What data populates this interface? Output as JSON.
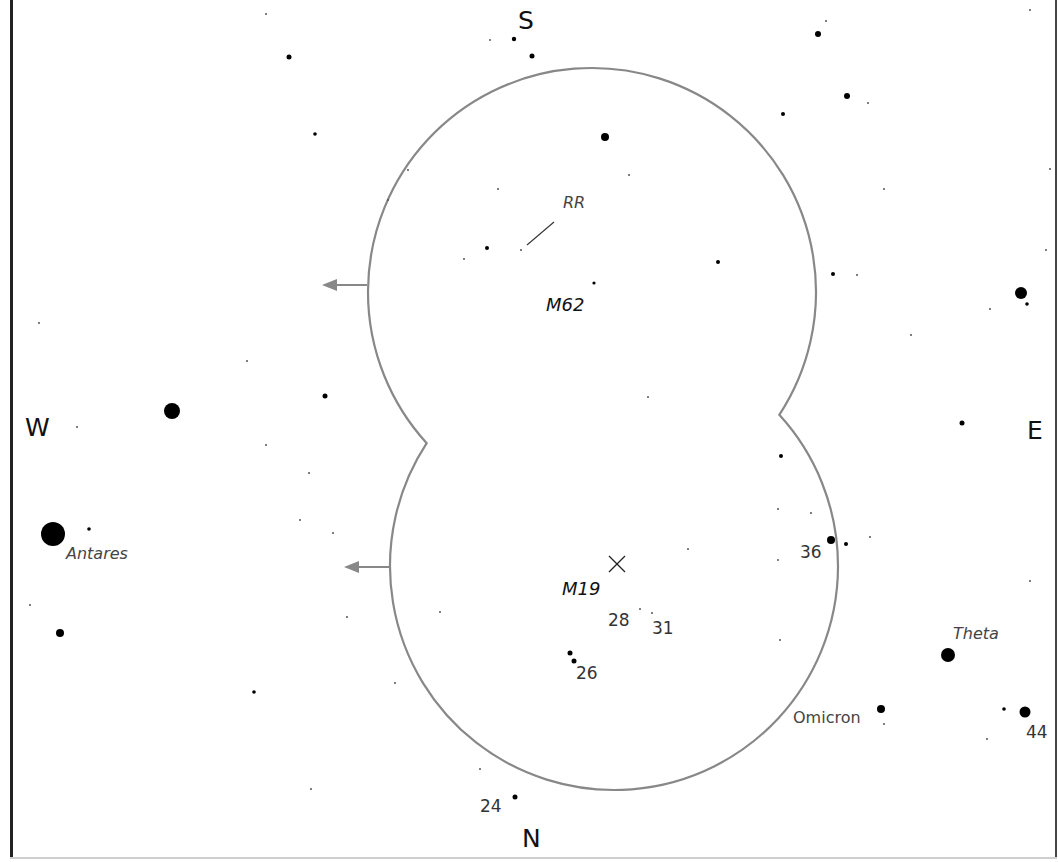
{
  "chart": {
    "background": "#ffffff",
    "field_color": "#888888",
    "star_color": "#000000",
    "directions": [
      {
        "id": "S",
        "label": "S",
        "x": 518,
        "y": 8
      },
      {
        "id": "N",
        "label": "N",
        "x": 522,
        "y": 826
      },
      {
        "id": "W",
        "label": "W",
        "x": 25,
        "y": 415
      },
      {
        "id": "E",
        "label": "E",
        "x": 1027,
        "y": 418
      }
    ],
    "fields_of_view": [
      {
        "name": "upper-field",
        "cx": 592,
        "cy": 292,
        "r": 224
      },
      {
        "name": "lower-field",
        "cx": 614,
        "cy": 566,
        "r": 224
      }
    ],
    "motion_arrows": [
      {
        "name": "upper-arrow",
        "x1": 367,
        "y1": 285,
        "x2": 322,
        "y2": 285
      },
      {
        "name": "lower-arrow",
        "x1": 389,
        "y1": 567,
        "x2": 344,
        "y2": 567
      }
    ],
    "objects": [
      {
        "id": "M62",
        "label": "M62",
        "x": 546,
        "y": 296,
        "marker": "dot",
        "mx": 593,
        "my": 283
      },
      {
        "id": "M19",
        "label": "M19",
        "x": 562,
        "y": 580,
        "marker": "cross",
        "mx": 617,
        "my": 564
      }
    ],
    "variable_star": {
      "label": "RR",
      "x": 563,
      "y": 195,
      "line": {
        "x1": 554,
        "y1": 222,
        "x2": 527,
        "y2": 245
      }
    },
    "named_stars": [
      {
        "label": "Antares",
        "x": 66,
        "y": 546,
        "italic": true
      },
      {
        "label": "Theta",
        "x": 953,
        "y": 626,
        "italic": true
      },
      {
        "label": "Omicron",
        "x": 793,
        "y": 710,
        "italic": false
      }
    ],
    "numbered_stars": [
      {
        "label": "36",
        "x": 800,
        "y": 544
      },
      {
        "label": "28",
        "x": 608,
        "y": 612
      },
      {
        "label": "31",
        "x": 652,
        "y": 620
      },
      {
        "label": "26",
        "x": 576,
        "y": 665
      },
      {
        "label": "24",
        "x": 480,
        "y": 798
      },
      {
        "label": "44",
        "x": 1026,
        "y": 724
      }
    ],
    "stars": [
      {
        "x": 53,
        "y": 534,
        "r": 12
      },
      {
        "x": 172,
        "y": 411,
        "r": 8
      },
      {
        "x": 948,
        "y": 655,
        "r": 7
      },
      {
        "x": 1021,
        "y": 293,
        "r": 6
      },
      {
        "x": 1025,
        "y": 712,
        "r": 5.5
      },
      {
        "x": 605,
        "y": 137,
        "r": 4
      },
      {
        "x": 60,
        "y": 633,
        "r": 4
      },
      {
        "x": 831,
        "y": 540,
        "r": 4
      },
      {
        "x": 881,
        "y": 709,
        "r": 4
      },
      {
        "x": 818,
        "y": 34,
        "r": 3
      },
      {
        "x": 847,
        "y": 96,
        "r": 3
      },
      {
        "x": 289,
        "y": 57,
        "r": 2.5
      },
      {
        "x": 532,
        "y": 56,
        "r": 2.5
      },
      {
        "x": 514,
        "y": 39,
        "r": 2.2
      },
      {
        "x": 325,
        "y": 396,
        "r": 2.5
      },
      {
        "x": 962,
        "y": 423,
        "r": 2.5
      },
      {
        "x": 570,
        "y": 653,
        "r": 2.5
      },
      {
        "x": 574,
        "y": 661,
        "r": 2.5
      },
      {
        "x": 515,
        "y": 797,
        "r": 2.5
      },
      {
        "x": 487,
        "y": 248,
        "r": 2
      },
      {
        "x": 718,
        "y": 262,
        "r": 2
      },
      {
        "x": 783,
        "y": 114,
        "r": 2
      },
      {
        "x": 833,
        "y": 274,
        "r": 2
      },
      {
        "x": 781,
        "y": 456,
        "r": 2
      },
      {
        "x": 846,
        "y": 544,
        "r": 2
      },
      {
        "x": 1027,
        "y": 304,
        "r": 1.8
      },
      {
        "x": 1004,
        "y": 709,
        "r": 1.8
      },
      {
        "x": 89,
        "y": 529,
        "r": 1.8
      },
      {
        "x": 315,
        "y": 134,
        "r": 1.8
      },
      {
        "x": 254,
        "y": 692,
        "r": 1.8
      },
      {
        "x": 594,
        "y": 283,
        "r": 1.6
      },
      {
        "x": 266,
        "y": 14,
        "r": 1
      },
      {
        "x": 490,
        "y": 40,
        "r": 1
      },
      {
        "x": 826,
        "y": 21,
        "r": 1
      },
      {
        "x": 868,
        "y": 103,
        "r": 1
      },
      {
        "x": 884,
        "y": 189,
        "r": 1
      },
      {
        "x": 1050,
        "y": 169,
        "r": 1
      },
      {
        "x": 1046,
        "y": 250,
        "r": 1
      },
      {
        "x": 990,
        "y": 309,
        "r": 1
      },
      {
        "x": 911,
        "y": 335,
        "r": 1
      },
      {
        "x": 857,
        "y": 275,
        "r": 1
      },
      {
        "x": 498,
        "y": 189,
        "r": 1
      },
      {
        "x": 629,
        "y": 175,
        "r": 1
      },
      {
        "x": 464,
        "y": 259,
        "r": 1
      },
      {
        "x": 521,
        "y": 250,
        "r": 1
      },
      {
        "x": 408,
        "y": 170,
        "r": 1
      },
      {
        "x": 388,
        "y": 200,
        "r": 1
      },
      {
        "x": 648,
        "y": 397,
        "r": 1
      },
      {
        "x": 39,
        "y": 323,
        "r": 1
      },
      {
        "x": 247,
        "y": 361,
        "r": 1
      },
      {
        "x": 77,
        "y": 427,
        "r": 1
      },
      {
        "x": 266,
        "y": 445,
        "r": 1
      },
      {
        "x": 309,
        "y": 473,
        "r": 1
      },
      {
        "x": 300,
        "y": 520,
        "r": 1
      },
      {
        "x": 333,
        "y": 533,
        "r": 1
      },
      {
        "x": 30,
        "y": 605,
        "r": 1
      },
      {
        "x": 347,
        "y": 617,
        "r": 1
      },
      {
        "x": 311,
        "y": 789,
        "r": 1
      },
      {
        "x": 440,
        "y": 612,
        "r": 1
      },
      {
        "x": 395,
        "y": 683,
        "r": 1
      },
      {
        "x": 480,
        "y": 769,
        "r": 1
      },
      {
        "x": 688,
        "y": 549,
        "r": 1
      },
      {
        "x": 778,
        "y": 509,
        "r": 1
      },
      {
        "x": 778,
        "y": 560,
        "r": 1
      },
      {
        "x": 811,
        "y": 513,
        "r": 1
      },
      {
        "x": 870,
        "y": 537,
        "r": 1
      },
      {
        "x": 1030,
        "y": 581,
        "r": 1
      },
      {
        "x": 780,
        "y": 640,
        "r": 1
      },
      {
        "x": 640,
        "y": 609,
        "r": 1
      },
      {
        "x": 652,
        "y": 613,
        "r": 1
      },
      {
        "x": 884,
        "y": 724,
        "r": 1
      },
      {
        "x": 987,
        "y": 739,
        "r": 1
      },
      {
        "x": 1030,
        "y": 10,
        "r": 1
      }
    ]
  }
}
